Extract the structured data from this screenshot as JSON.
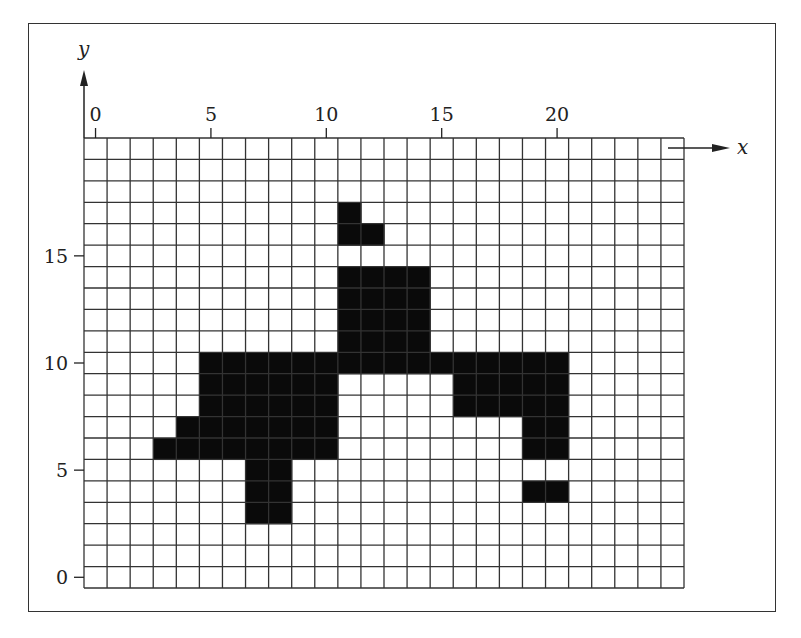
{
  "figure": {
    "axes": {
      "x_label": "x",
      "y_label": "y",
      "x_ticks": [
        {
          "value": 0,
          "label": "0"
        },
        {
          "value": 5,
          "label": "5"
        },
        {
          "value": 10,
          "label": "10"
        },
        {
          "value": 15,
          "label": "15"
        },
        {
          "value": 20,
          "label": "20"
        }
      ],
      "y_ticks": [
        {
          "value": 0,
          "label": "0"
        },
        {
          "value": 5,
          "label": "5"
        },
        {
          "value": 10,
          "label": "10"
        },
        {
          "value": 15,
          "label": "15"
        }
      ]
    },
    "grid": {
      "columns": 26,
      "rows": 21,
      "x_range": [
        0,
        25
      ],
      "y_range": [
        0,
        20
      ],
      "line_color": "#333333",
      "fill_color": "#0a0a0a",
      "background": "#ffffff"
    },
    "filled_cells": [
      [
        11,
        17
      ],
      [
        11,
        16
      ],
      [
        12,
        16
      ],
      [
        11,
        14
      ],
      [
        12,
        14
      ],
      [
        13,
        14
      ],
      [
        14,
        14
      ],
      [
        11,
        13
      ],
      [
        12,
        13
      ],
      [
        13,
        13
      ],
      [
        14,
        13
      ],
      [
        11,
        12
      ],
      [
        12,
        12
      ],
      [
        13,
        12
      ],
      [
        14,
        12
      ],
      [
        11,
        11
      ],
      [
        12,
        11
      ],
      [
        13,
        11
      ],
      [
        14,
        11
      ],
      [
        5,
        10
      ],
      [
        6,
        10
      ],
      [
        7,
        10
      ],
      [
        8,
        10
      ],
      [
        9,
        10
      ],
      [
        10,
        10
      ],
      [
        11,
        10
      ],
      [
        12,
        10
      ],
      [
        13,
        10
      ],
      [
        14,
        10
      ],
      [
        15,
        10
      ],
      [
        16,
        10
      ],
      [
        17,
        10
      ],
      [
        18,
        10
      ],
      [
        19,
        10
      ],
      [
        20,
        10
      ],
      [
        5,
        9
      ],
      [
        6,
        9
      ],
      [
        7,
        9
      ],
      [
        8,
        9
      ],
      [
        9,
        9
      ],
      [
        10,
        9
      ],
      [
        16,
        9
      ],
      [
        17,
        9
      ],
      [
        18,
        9
      ],
      [
        19,
        9
      ],
      [
        20,
        9
      ],
      [
        5,
        8
      ],
      [
        6,
        8
      ],
      [
        7,
        8
      ],
      [
        8,
        8
      ],
      [
        9,
        8
      ],
      [
        10,
        8
      ],
      [
        16,
        8
      ],
      [
        17,
        8
      ],
      [
        18,
        8
      ],
      [
        19,
        8
      ],
      [
        20,
        8
      ],
      [
        4,
        7
      ],
      [
        5,
        7
      ],
      [
        6,
        7
      ],
      [
        7,
        7
      ],
      [
        8,
        7
      ],
      [
        9,
        7
      ],
      [
        10,
        7
      ],
      [
        19,
        7
      ],
      [
        20,
        7
      ],
      [
        3,
        6
      ],
      [
        4,
        6
      ],
      [
        5,
        6
      ],
      [
        6,
        6
      ],
      [
        7,
        6
      ],
      [
        8,
        6
      ],
      [
        9,
        6
      ],
      [
        10,
        6
      ],
      [
        19,
        6
      ],
      [
        20,
        6
      ],
      [
        7,
        5
      ],
      [
        8,
        5
      ],
      [
        7,
        4
      ],
      [
        8,
        4
      ],
      [
        19,
        4
      ],
      [
        20,
        4
      ],
      [
        7,
        3
      ],
      [
        8,
        3
      ]
    ]
  }
}
